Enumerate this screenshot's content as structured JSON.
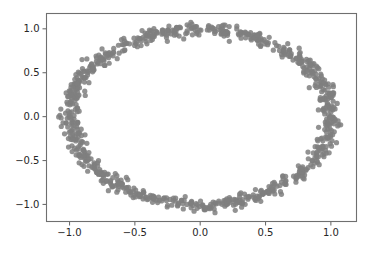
{
  "figure": {
    "width": 385,
    "height": 258,
    "background_color": "#ffffff",
    "title": "",
    "axes_rect": {
      "left": 46,
      "top": 13,
      "right": 357,
      "bottom": 222
    },
    "spine_color": "#6f6f6f",
    "tick_label_color": "#262626",
    "tick_label_font_size": 10
  },
  "chart_data": {
    "type": "scatter",
    "title": "",
    "xlabel": "",
    "ylabel": "",
    "xlim": [
      -1.18,
      1.2
    ],
    "ylim": [
      -1.2,
      1.18
    ],
    "xticks": [
      -1.0,
      -0.5,
      0.0,
      0.5,
      1.0
    ],
    "yticks": [
      -1.0,
      -0.5,
      0.0,
      0.5,
      1.0
    ],
    "xticklabels": [
      "−1.0",
      "−0.5",
      "0.0",
      "0.5",
      "1.0"
    ],
    "yticklabels": [
      "−1.0",
      "−0.5",
      "0.0",
      "0.5",
      "1.0"
    ],
    "grid": false,
    "legend": null,
    "legend_position": "none",
    "series": [
      {
        "name": "noisy unit circle",
        "marker": "o",
        "color": "#7f7f7f",
        "marker_size": 5.2,
        "alpha": 0.85,
        "n_points": 900,
        "description": "Points sampled uniformly on a unit circle with small gaussian radial jitter (sigma approx 0.035); forms a ring centered at origin with radius approximately 1.0",
        "generator": {
          "shape": "circle",
          "center": [
            0.0,
            0.0
          ],
          "radius": 1.0,
          "radial_noise_sigma": 0.035,
          "angular_distribution": "uniform"
        }
      }
    ]
  }
}
